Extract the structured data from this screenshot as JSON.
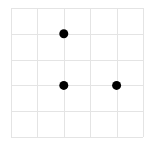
{
  "grid": {
    "columns": 5,
    "rows": 5,
    "origin_x": 11,
    "origin_y": 8,
    "cell_width": 26.4,
    "cell_height": 25.8,
    "line_color": "#e4e4e4",
    "line_width": 1
  },
  "dots": [
    {
      "col": 2,
      "row": 1
    },
    {
      "col": 2,
      "row": 3
    },
    {
      "col": 4,
      "row": 3
    }
  ],
  "dot_style": {
    "color": "#000000",
    "radius": 4.5
  }
}
